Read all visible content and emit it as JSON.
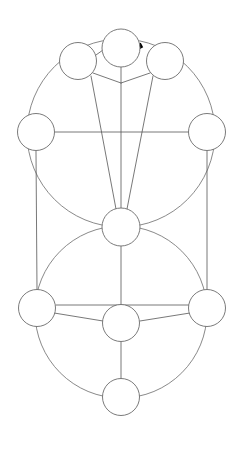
{
  "canvas": {
    "width": 244,
    "height": 450,
    "background": "#ffffff",
    "title": "Tree of Life Diagram"
  },
  "style": {
    "stroke_color": "#6b6b6b",
    "stroke_color_dark": "#555555",
    "node_fill": "#ffffff",
    "node_stroke_width": 0.9,
    "path_stroke_width": 0.8,
    "highlight_color": "#000000",
    "highlight_stroke_width": 5
  },
  "nodes": [
    {
      "id": "node-top-center",
      "label": "1",
      "cx": 121,
      "cy": 48,
      "r": 19
    },
    {
      "id": "node-top-left",
      "label": "2",
      "cx": 78,
      "cy": 61,
      "r": 18.5
    },
    {
      "id": "node-top-right",
      "label": "3",
      "cx": 165,
      "cy": 61,
      "r": 18.5
    },
    {
      "id": "node-mid-left",
      "label": "4",
      "cx": 36,
      "cy": 132,
      "r": 18.5
    },
    {
      "id": "node-mid-right",
      "label": "5",
      "cx": 207,
      "cy": 132,
      "r": 18.5
    },
    {
      "id": "node-center",
      "label": "6",
      "cx": 121,
      "cy": 227,
      "r": 19
    },
    {
      "id": "node-low-left",
      "label": "7",
      "cx": 37,
      "cy": 308,
      "r": 18.5
    },
    {
      "id": "node-low-right",
      "label": "8",
      "cx": 207,
      "cy": 308,
      "r": 18.5
    },
    {
      "id": "node-low-center",
      "label": "9",
      "cx": 121,
      "cy": 323,
      "r": 18.5
    },
    {
      "id": "node-bottom",
      "label": "10",
      "cx": 121,
      "cy": 397,
      "r": 18.5
    }
  ],
  "big_circles": [
    {
      "id": "upper-great-circle",
      "cx": 121,
      "cy": 133,
      "r": 94
    },
    {
      "id": "lower-great-circle",
      "cx": 121,
      "cy": 312,
      "r": 86
    }
  ],
  "paths": [
    {
      "id": "path-topleft-topcenter",
      "from": "node-top-left",
      "to": "node-top-center",
      "x1": 96,
      "y1": 55,
      "x2": 103,
      "y2": 50
    },
    {
      "id": "path-topleft-fan",
      "from": "node-top-left",
      "to": "node-fan-apex",
      "x1": 93,
      "y1": 73,
      "x2": 121,
      "y2": 83
    },
    {
      "id": "path-topright-fan",
      "from": "node-top-right",
      "to": "node-fan-apex",
      "x1": 150,
      "y1": 73,
      "x2": 121,
      "y2": 83
    },
    {
      "id": "path-topleft-center",
      "from": "node-top-left",
      "to": "node-center",
      "x1": 91,
      "y1": 76,
      "x2": 116,
      "y2": 209
    },
    {
      "id": "path-topcenter-center",
      "from": "node-top-center",
      "to": "node-center",
      "x1": 121,
      "y1": 67,
      "x2": 121,
      "y2": 208
    },
    {
      "id": "path-topright-center",
      "from": "node-top-right",
      "to": "node-center",
      "x1": 153,
      "y1": 76,
      "x2": 127,
      "y2": 209
    },
    {
      "id": "path-midleft-midright",
      "from": "node-mid-left",
      "to": "node-mid-right",
      "x1": 55,
      "y1": 132,
      "x2": 189,
      "y2": 132
    },
    {
      "id": "path-midleft-lowleft",
      "from": "node-mid-left",
      "to": "node-low-left",
      "x1": 36,
      "y1": 151,
      "x2": 37,
      "y2": 290
    },
    {
      "id": "path-midright-lowright",
      "from": "node-mid-right",
      "to": "node-low-right",
      "x1": 207,
      "y1": 151,
      "x2": 207,
      "y2": 290
    },
    {
      "id": "path-center-lowcenter",
      "from": "node-center",
      "to": "node-low-center",
      "x1": 121,
      "y1": 246,
      "x2": 121,
      "y2": 305
    },
    {
      "id": "path-lowleft-lowright",
      "from": "node-low-left",
      "to": "node-low-right",
      "x1": 56,
      "y1": 305,
      "x2": 189,
      "y2": 305
    },
    {
      "id": "path-lowleft-lowcenter",
      "from": "node-low-left",
      "to": "node-low-center",
      "x1": 54,
      "y1": 313,
      "x2": 103,
      "y2": 321
    },
    {
      "id": "path-lowright-lowcenter",
      "from": "node-low-right",
      "to": "node-low-center",
      "x1": 190,
      "y1": 313,
      "x2": 140,
      "y2": 321
    },
    {
      "id": "path-lowcenter-bottom",
      "from": "node-low-center",
      "to": "node-bottom",
      "x1": 121,
      "y1": 342,
      "x2": 121,
      "y2": 379
    }
  ],
  "highlight": {
    "id": "highlighted-segment",
    "description": "thick black stroke between top-center and top-right node",
    "x1": 131,
    "y1": 51,
    "x2": 142,
    "y2": 45
  }
}
